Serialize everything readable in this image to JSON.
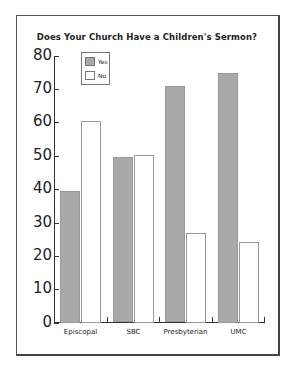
{
  "chart_data": {
    "type": "bar",
    "title": "Does Your Church Have a Children's Sermon?",
    "categories": [
      "Episcopal",
      "SBC",
      "Presbyterian",
      "UMC"
    ],
    "series": [
      {
        "name": "Yes",
        "color": "#a9a9a9",
        "values": [
          39.5,
          49.5,
          70.8,
          74.9
        ]
      },
      {
        "name": "No",
        "color": "#ffffff",
        "values": [
          60.5,
          50.2,
          26.8,
          24.3
        ]
      }
    ],
    "xlabel": "",
    "ylabel": "",
    "ylim": [
      0,
      80
    ],
    "yticks": [
      0,
      10,
      20,
      30,
      40,
      50,
      60,
      70,
      80
    ],
    "grid": false,
    "legend_position": "upper-left-inside"
  },
  "title": "Does Your Church Have a Children's Sermon?",
  "yticks": [
    "0",
    "10",
    "20",
    "30",
    "40",
    "50",
    "60",
    "70",
    "80"
  ],
  "categories": [
    "Episcopal",
    "SBC",
    "Presbyterian",
    "UMC"
  ],
  "legend": {
    "yes": "Yes",
    "no": "No"
  }
}
